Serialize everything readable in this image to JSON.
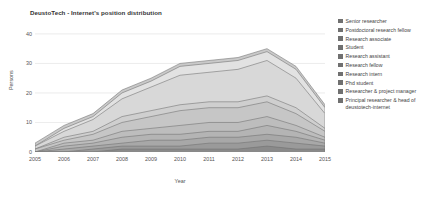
{
  "chart_data": {
    "type": "area",
    "stacked": true,
    "title": "DeustoTech - Internet's position distribution",
    "xlabel": "Year",
    "ylabel": "Persons",
    "grid": true,
    "legend_position": "right",
    "xlim": [
      2005,
      2015
    ],
    "ylim": [
      0,
      42
    ],
    "x": [
      2005,
      2006,
      2007,
      2008,
      2009,
      2010,
      2011,
      2012,
      2013,
      2014,
      2015
    ],
    "xticks": [
      "2005",
      "2006",
      "2007",
      "2008",
      "2009",
      "2010",
      "2011",
      "2012",
      "2013",
      "2014",
      "2015"
    ],
    "yticks": [
      "0",
      "10",
      "20",
      "30",
      "40"
    ],
    "ytick_values": [
      0,
      10,
      20,
      30,
      40
    ],
    "series": [
      {
        "name": "Senior researcher",
        "color": "#8a8a8a",
        "values": [
          0,
          0,
          0,
          1,
          1,
          1,
          1,
          1,
          2,
          1,
          1
        ]
      },
      {
        "name": "Postdoctoral research fellow",
        "color": "#9a9a9a",
        "values": [
          0,
          0,
          1,
          1,
          1,
          1,
          2,
          2,
          2,
          2,
          1
        ]
      },
      {
        "name": "Research associate",
        "color": "#a8a8a8",
        "values": [
          0,
          1,
          1,
          1,
          2,
          2,
          2,
          2,
          2,
          2,
          1
        ]
      },
      {
        "name": "Student",
        "color": "#b4b4b4",
        "values": [
          0,
          1,
          1,
          2,
          2,
          2,
          2,
          2,
          3,
          2,
          1
        ]
      },
      {
        "name": "Research assistant",
        "color": "#bdbdbd",
        "values": [
          0,
          1,
          1,
          2,
          2,
          3,
          3,
          3,
          3,
          2,
          1
        ]
      },
      {
        "name": "Research fellow",
        "color": "#c6c6c6",
        "values": [
          1,
          1,
          2,
          3,
          4,
          5,
          5,
          5,
          5,
          4,
          2
        ]
      },
      {
        "name": "Research intern",
        "color": "#cfcfcf",
        "values": [
          0,
          1,
          1,
          2,
          2,
          2,
          2,
          2,
          2,
          2,
          1
        ]
      },
      {
        "name": "Phd student",
        "color": "#d8d8d8",
        "values": [
          1,
          2,
          4,
          6,
          8,
          10,
          10,
          11,
          12,
          10,
          5
        ]
      },
      {
        "name": "Researcher & project manager",
        "color": "#e2e2e2",
        "values": [
          0,
          1,
          1,
          2,
          2,
          3,
          3,
          3,
          3,
          3,
          2
        ]
      },
      {
        "name": "Principal researcher & head of deustotech-internet",
        "color": "#c9c9c9",
        "values": [
          1,
          1,
          1,
          1,
          1,
          1,
          1,
          1,
          1,
          1,
          1
        ]
      }
    ]
  },
  "legend": {
    "items": [
      {
        "label": "Senior researcher"
      },
      {
        "label": "Postdoctoral research fellow"
      },
      {
        "label": "Research associate"
      },
      {
        "label": "Student"
      },
      {
        "label": "Research assistant"
      },
      {
        "label": "Research fellow"
      },
      {
        "label": "Research intern"
      },
      {
        "label": "Phd student"
      },
      {
        "label": "Researcher & project manager"
      },
      {
        "label": "Principal researcher & head of deustotech-internet"
      }
    ]
  }
}
